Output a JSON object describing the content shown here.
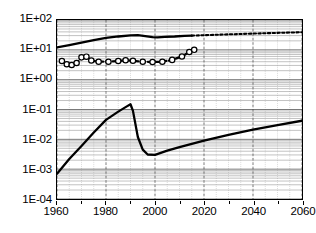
{
  "chart_data": {
    "type": "line",
    "title": "",
    "xlabel": "",
    "ylabel": "",
    "xlim": [
      1960,
      2060
    ],
    "ylim": [
      0.0001,
      100
    ],
    "yscale": "log",
    "xscale": "linear",
    "grid": "major and minor logarithmic grid, vertical gridlines every 5 years",
    "legend": "none",
    "xticks": [
      "1960",
      "1980",
      "2000",
      "2020",
      "2040",
      "2060"
    ],
    "xtick_values": [
      1960,
      1980,
      2000,
      2020,
      2040,
      2060
    ],
    "yticks": [
      "1E+02",
      "1E+01",
      "1E+00",
      "1E-01",
      "1E-02",
      "1E-03",
      "1E-04"
    ],
    "ytick_values": [
      100,
      10,
      1,
      0.1,
      0.01,
      0.001,
      0.0001
    ],
    "series": [
      {
        "name": "upper-solid-line",
        "style": "solid",
        "marker": "none",
        "color": "#000000",
        "x": [
          1960,
          1965,
          1970,
          1975,
          1980,
          1985,
          1990,
          1993,
          1996,
          1999,
          2001,
          2004,
          2008,
          2012,
          2015
        ],
        "values": [
          12,
          14.5,
          17.5,
          21,
          25,
          28,
          30.5,
          31,
          29,
          26.5,
          26,
          27,
          28,
          29.5,
          30
        ]
      },
      {
        "name": "upper-dotted-projection",
        "style": "dotted",
        "marker": "none",
        "color": "#000000",
        "x": [
          2015,
          2020,
          2025,
          2030,
          2035,
          2040,
          2045,
          2050,
          2055,
          2060
        ],
        "values": [
          30,
          31,
          32,
          33,
          34,
          35,
          36,
          37,
          38,
          39
        ]
      },
      {
        "name": "middle-dashed-line-with-circles",
        "style": "dashed",
        "marker": "open-circle",
        "color": "#000000",
        "x": [
          1962,
          1964,
          1966,
          1968,
          1970,
          1972,
          1974,
          1977,
          1981,
          1985,
          1988,
          1991,
          1995,
          1999,
          2003,
          2007,
          2011,
          2014,
          2016
        ],
        "values": [
          4.2,
          3.3,
          3.1,
          3.6,
          5.6,
          5.9,
          4.4,
          4.0,
          4.0,
          4.2,
          4.5,
          4.3,
          4.0,
          3.9,
          4.0,
          4.6,
          6.0,
          8.5,
          10.0
        ]
      },
      {
        "name": "lower-solid-line",
        "style": "solid",
        "marker": "none",
        "color": "#000000",
        "x": [
          1960,
          1965,
          1970,
          1975,
          1980,
          1985,
          1988,
          1990,
          1991,
          1993,
          1995,
          1997,
          2000,
          2005,
          2010,
          2020,
          2030,
          2040,
          2050,
          2060
        ],
        "values": [
          0.0007,
          0.0022,
          0.006,
          0.017,
          0.045,
          0.085,
          0.12,
          0.15,
          0.09,
          0.012,
          0.0045,
          0.0031,
          0.003,
          0.0042,
          0.0055,
          0.009,
          0.014,
          0.021,
          0.03,
          0.042
        ]
      }
    ]
  }
}
